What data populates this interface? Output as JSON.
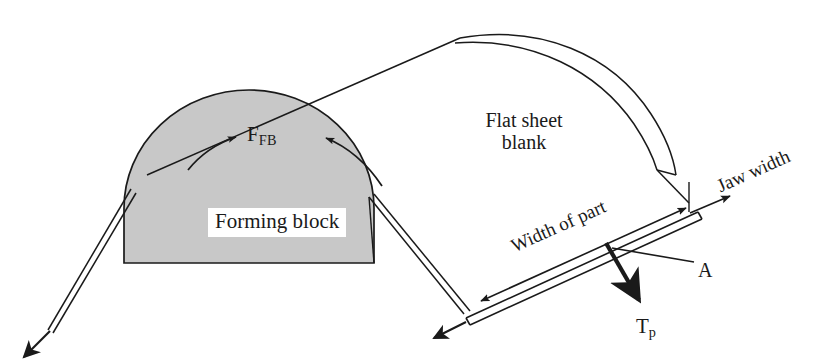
{
  "figure": {
    "kind": "engineering-process-diagram",
    "title_visible": false,
    "background_color": "#ffffff",
    "line_color": "#1a1a1a",
    "forming_block_fill": "#c8c8c8",
    "label_text_color": "#1a1a1a"
  },
  "labels": {
    "forming_block": "Forming block",
    "flat_sheet_line1": "Flat sheet",
    "flat_sheet_line2": "blank",
    "force_forming_block_main": "F",
    "force_forming_block_sub": "FB",
    "tension_part_main": "T",
    "tension_part_sub": "p",
    "section_a": "A",
    "jaw_width": "Jaw width",
    "width_of_part": "Width of part"
  },
  "annotations": {
    "ffb_arrow_left_name": "curved-friction-arrow-left",
    "ffb_arrow_right_name": "curved-friction-arrow-right",
    "tp_arrow_name": "tension-force-arrow",
    "jaw_arrow_name": "jaw-width-arrow",
    "width_dimension_name": "width-of-part-dimension-arrow",
    "leader_a_name": "section-a-leader-line",
    "sheet_left_arrow_name": "sheet-left-pull-arrow"
  },
  "geometry_notes": {
    "forming_block_shape": "semicircular dome on flat base",
    "sheet_wraps_over_block": true,
    "jaw_strip_orientation_deg": -24
  }
}
